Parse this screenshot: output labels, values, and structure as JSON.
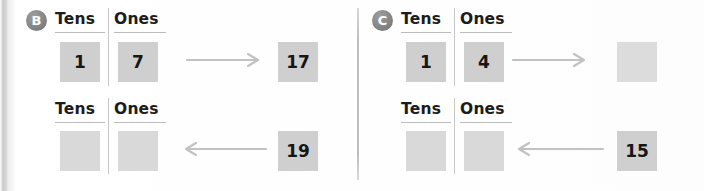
{
  "worksheet": {
    "type": "place-value-tens-ones",
    "column_headers": [
      "Tens",
      "Ones"
    ],
    "panels": [
      {
        "marker": "B",
        "marker_name": "problem-marker-b",
        "rows": [
          {
            "row_name": "row-b-1",
            "direction": "right",
            "arrow_glyph": "→",
            "tens": "1",
            "ones": "7",
            "answer": "17",
            "tens_blank": false,
            "ones_blank": false,
            "answer_blank": false
          },
          {
            "row_name": "row-b-2",
            "direction": "left",
            "arrow_glyph": "←",
            "tens": "",
            "ones": "",
            "answer": "19",
            "tens_blank": true,
            "ones_blank": true,
            "answer_blank": false
          }
        ]
      },
      {
        "marker": "C",
        "marker_name": "problem-marker-c",
        "rows": [
          {
            "row_name": "row-c-1",
            "direction": "right",
            "arrow_glyph": "→",
            "tens": "1",
            "ones": "4",
            "answer": "",
            "tens_blank": false,
            "ones_blank": false,
            "answer_blank": true
          },
          {
            "row_name": "row-c-2",
            "direction": "left",
            "arrow_glyph": "←",
            "tens": "",
            "ones": "",
            "answer": "15",
            "tens_blank": true,
            "ones_blank": true,
            "answer_blank": false
          }
        ]
      }
    ]
  },
  "colors": {
    "cell_fill": "#cfcfcf",
    "cell_blank_fill": "#d9d9d9",
    "marker_fill": "#8a8a8a",
    "marker_text": "#ffffff",
    "arrow": "#c2c2c2",
    "rule": "#bcbcbc",
    "text": "#161616",
    "background": "#ffffff"
  }
}
